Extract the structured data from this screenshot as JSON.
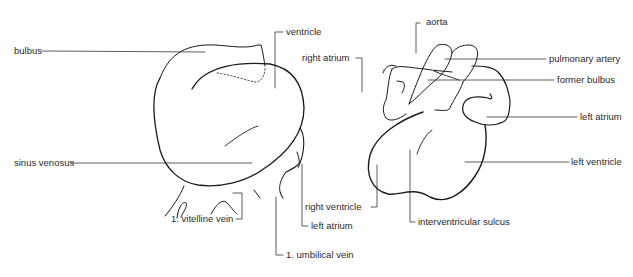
{
  "figure": {
    "left_panel": {
      "name": "early embryonic heart",
      "labels": {
        "bulbus": "bulbus",
        "ventricle": "ventricle",
        "sinus_venosus": "sinus venosus",
        "vitelline_vein": "1. vitelline vein",
        "umbilical_vein": "1. umbilical vein",
        "left_atrium": "left atrium"
      }
    },
    "right_panel": {
      "name": "later embryonic heart",
      "labels": {
        "aorta": "aorta",
        "right_atrium": "right atrium",
        "pulmonary_artery": "pulmonary artery",
        "former_bulbus": "former bulbus",
        "left_atrium": "left atrium",
        "left_ventricle": "left ventricle",
        "right_ventricle": "right ventricle",
        "interventricular_sulcus": "interventricular sulcus"
      }
    },
    "colors": {
      "line": "#1a1a1a",
      "leader": "#333333",
      "text": "#2a2a2a",
      "background": "#ffffff"
    }
  }
}
